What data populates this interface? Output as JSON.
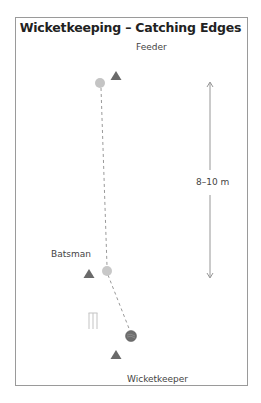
{
  "title": "Wicketkeeping – Catching Edges",
  "labels": {
    "feeder": "Feeder",
    "batsman": "Batsman",
    "wicketkeeper": "Wicketkeeper",
    "distance": "8–10 m"
  },
  "colors": {
    "cone": "#6a6a6a",
    "ball_light": "#c4c4c4",
    "ball_dark": "#6e6e6e",
    "line": "#999999",
    "stumps": "#c8c8c8"
  },
  "elements": [
    {
      "type": "cone",
      "name": "feeder-cone",
      "x": 116,
      "y": 76
    },
    {
      "type": "ball",
      "name": "feeder-ball",
      "x": 100,
      "y": 83
    },
    {
      "type": "cone",
      "name": "batsman-cone",
      "x": 89,
      "y": 274
    },
    {
      "type": "ball",
      "name": "batsman-ball",
      "x": 107,
      "y": 271
    },
    {
      "type": "stumps",
      "name": "stumps",
      "x": 93,
      "y": 321
    },
    {
      "type": "ball",
      "name": "edged-ball",
      "x": 131,
      "y": 336
    },
    {
      "type": "cone",
      "name": "wicketkeeper-cone",
      "x": 116,
      "y": 356
    }
  ]
}
